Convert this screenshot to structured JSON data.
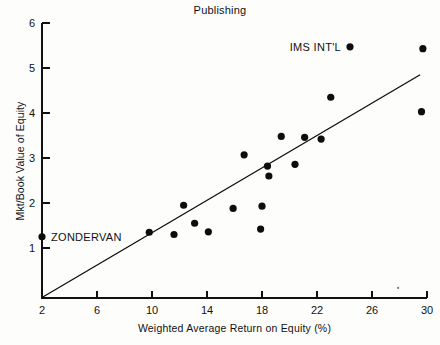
{
  "chart_data": {
    "type": "scatter",
    "title": "Publishing",
    "xlabel": "Weighted Average Return on Equity (%)",
    "ylabel": "Mkt/Book Value of Equity",
    "xlim": [
      2,
      30
    ],
    "ylim": [
      0,
      6
    ],
    "xticks": [
      2,
      6,
      10,
      14,
      18,
      22,
      26,
      30
    ],
    "yticks": [
      1,
      2,
      3,
      4,
      5,
      6
    ],
    "grid": false,
    "legend": null,
    "points": [
      {
        "x": 2.0,
        "y": 1.25,
        "label": "ZONDERVAN"
      },
      {
        "x": 9.8,
        "y": 1.35,
        "label": ""
      },
      {
        "x": 11.6,
        "y": 1.3,
        "label": ""
      },
      {
        "x": 12.3,
        "y": 1.95,
        "label": ""
      },
      {
        "x": 13.1,
        "y": 1.55,
        "label": ""
      },
      {
        "x": 14.1,
        "y": 1.36,
        "label": ""
      },
      {
        "x": 15.9,
        "y": 1.88,
        "label": ""
      },
      {
        "x": 16.7,
        "y": 3.07,
        "label": ""
      },
      {
        "x": 17.9,
        "y": 1.42,
        "label": ""
      },
      {
        "x": 18.0,
        "y": 1.93,
        "label": ""
      },
      {
        "x": 18.4,
        "y": 2.82,
        "label": ""
      },
      {
        "x": 18.5,
        "y": 2.6,
        "label": ""
      },
      {
        "x": 19.4,
        "y": 3.48,
        "label": ""
      },
      {
        "x": 20.4,
        "y": 2.86,
        "label": ""
      },
      {
        "x": 21.1,
        "y": 3.46,
        "label": ""
      },
      {
        "x": 22.3,
        "y": 3.42,
        "label": ""
      },
      {
        "x": 23.0,
        "y": 4.35,
        "label": ""
      },
      {
        "x": 24.4,
        "y": 5.47,
        "label": "IMS INT'L"
      },
      {
        "x": 29.7,
        "y": 5.43,
        "label": ""
      },
      {
        "x": 29.6,
        "y": 4.03,
        "label": ""
      }
    ],
    "trendline": {
      "x1": 2.0,
      "y1": -0.1,
      "x2": 29.5,
      "y2": 4.85
    },
    "annotations": [
      {
        "text": "ZONDERVAN",
        "x": 2.0,
        "y": 1.25,
        "position": "right"
      },
      {
        "text": "IMS INT'L",
        "x": 24.4,
        "y": 5.47,
        "position": "left"
      }
    ]
  },
  "axis": {
    "x_tick_labels": [
      "2",
      "6",
      "10",
      "14",
      "18",
      "22",
      "26",
      "30"
    ],
    "y_tick_labels": [
      "1",
      "2",
      "3",
      "4",
      "5",
      "6"
    ]
  }
}
